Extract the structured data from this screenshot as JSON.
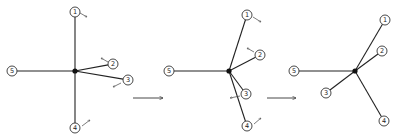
{
  "diagram": {
    "panels": [
      {
        "id": "stage-1",
        "hub": {
          "x": 75,
          "y": 71
        },
        "nodes": [
          {
            "label": "1",
            "x": 75,
            "y": 12,
            "motion": {
              "x1": 80,
              "y1": 13,
              "x2": 87,
              "y2": 17
            }
          },
          {
            "label": "2",
            "x": 113,
            "y": 64,
            "motion": {
              "x1": 108,
              "y1": 62,
              "x2": 101,
              "y2": 58
            }
          },
          {
            "label": "3",
            "x": 128,
            "y": 80,
            "motion": {
              "x1": 121,
              "y1": 83,
              "x2": 113,
              "y2": 87
            }
          },
          {
            "label": "4",
            "x": 75,
            "y": 128,
            "motion": {
              "x1": 82,
              "y1": 126,
              "x2": 90,
              "y2": 120
            }
          },
          {
            "label": "5",
            "x": 12,
            "y": 71,
            "motion": null
          }
        ]
      },
      {
        "id": "stage-2",
        "hub": {
          "x": 229,
          "y": 71
        },
        "nodes": [
          {
            "label": "1",
            "x": 247,
            "y": 15,
            "motion": {
              "x1": 253,
              "y1": 17,
              "x2": 261,
              "y2": 22
            }
          },
          {
            "label": "2",
            "x": 260,
            "y": 55,
            "motion": {
              "x1": 254,
              "y1": 52,
              "x2": 247,
              "y2": 48
            }
          },
          {
            "label": "3",
            "x": 246,
            "y": 94,
            "motion": {
              "x1": 240,
              "y1": 96,
              "x2": 230,
              "y2": 98
            }
          },
          {
            "label": "4",
            "x": 247,
            "y": 126,
            "motion": {
              "x1": 254,
              "y1": 124,
              "x2": 261,
              "y2": 118
            }
          },
          {
            "label": "5",
            "x": 169,
            "y": 71,
            "motion": null
          }
        ]
      },
      {
        "id": "stage-3",
        "hub": {
          "x": 355,
          "y": 71
        },
        "nodes": [
          {
            "label": "1",
            "x": 385,
            "y": 20,
            "motion": null
          },
          {
            "label": "2",
            "x": 382,
            "y": 51,
            "motion": null
          },
          {
            "label": "3",
            "x": 326,
            "y": 93,
            "motion": null
          },
          {
            "label": "4",
            "x": 384,
            "y": 121,
            "motion": null
          },
          {
            "label": "5",
            "x": 294,
            "y": 71,
            "motion": null
          }
        ]
      }
    ],
    "transitions": [
      {
        "from": "stage-1",
        "to": "stage-2",
        "x1": 133,
        "x2": 163,
        "y": 98
      },
      {
        "from": "stage-2",
        "to": "stage-3",
        "x1": 267,
        "x2": 296,
        "y": 98
      }
    ],
    "style": {
      "node_radius": 5,
      "hub_radius": 2.6,
      "line_color": "#222222",
      "background": "#ffffff"
    }
  }
}
